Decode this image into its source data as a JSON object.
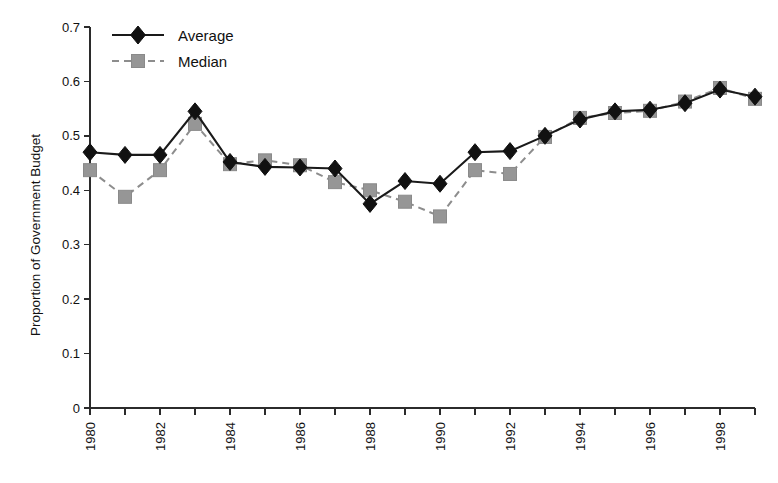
{
  "chart_data": {
    "type": "line",
    "title": "",
    "subtitle": "",
    "xlabel": "",
    "ylabel": "Proportion of Government Budget",
    "xlim": [
      1980,
      1999
    ],
    "ylim": [
      0,
      0.7
    ],
    "grid": false,
    "legend_position": "top-left",
    "x": [
      1980,
      1981,
      1982,
      1983,
      1984,
      1985,
      1986,
      1987,
      1988,
      1989,
      1990,
      1991,
      1992,
      1993,
      1994,
      1995,
      1996,
      1997,
      1998,
      1999
    ],
    "xtick_labels": [
      "1980",
      "1982",
      "1984",
      "1986",
      "1988",
      "1990",
      "1992",
      "1994",
      "1996",
      "1998"
    ],
    "xtick_values": [
      1980,
      1982,
      1984,
      1986,
      1988,
      1990,
      1992,
      1994,
      1996,
      1998
    ],
    "ytick_labels": [
      "0",
      "0.1",
      "0.2",
      "0.3",
      "0.4",
      "0.5",
      "0.6",
      "0.7"
    ],
    "ytick_values": [
      0,
      0.1,
      0.2,
      0.3,
      0.4,
      0.5,
      0.6,
      0.7
    ],
    "series": [
      {
        "name": "Average",
        "marker": "diamond",
        "color": "#111111",
        "line_style": "solid",
        "values": [
          0.47,
          0.465,
          0.465,
          0.545,
          0.452,
          0.443,
          0.442,
          0.44,
          0.375,
          0.417,
          0.412,
          0.47,
          0.472,
          0.5,
          0.53,
          0.545,
          0.548,
          0.56,
          0.585,
          0.572
        ]
      },
      {
        "name": "Median",
        "marker": "square",
        "color": "#969696",
        "line_style": "dashed",
        "values": [
          0.437,
          0.388,
          0.437,
          0.522,
          0.448,
          0.455,
          0.446,
          0.415,
          0.4,
          0.379,
          0.352,
          0.437,
          0.43,
          0.498,
          0.533,
          0.542,
          0.546,
          0.563,
          0.588,
          0.568
        ]
      }
    ]
  },
  "legend": {
    "items": [
      {
        "label": "Average"
      },
      {
        "label": "Median"
      }
    ]
  },
  "axes": {
    "y_title": "Proportion of Government Budget"
  }
}
